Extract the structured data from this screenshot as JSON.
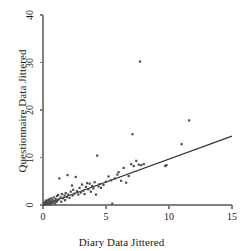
{
  "chart_data": {
    "type": "scatter",
    "title": "",
    "xlabel": "Diary Data Jittered",
    "ylabel": "Questionnaire Data Jittered",
    "xlim": [
      0,
      15
    ],
    "ylim": [
      0,
      40
    ],
    "xticks": [
      0,
      5,
      10,
      15
    ],
    "yticks": [
      0,
      10,
      20,
      30,
      40
    ],
    "xtick_labels": [
      "0",
      "5",
      "10",
      "15"
    ],
    "ytick_labels": [
      "0",
      "10",
      "20",
      "30",
      "40"
    ],
    "grid": false,
    "legend": null,
    "marker_color": "#4d4d4d",
    "line_color": "#333333",
    "axis_color": "#808080",
    "trendline": {
      "type": "linear",
      "x": [
        0,
        15
      ],
      "y": [
        0.0,
        14.5
      ],
      "slope": 0.967,
      "intercept": 0.0
    },
    "points": [
      {
        "x": 0.05,
        "y": 0.1
      },
      {
        "x": 0.08,
        "y": 0.3
      },
      {
        "x": 0.1,
        "y": 0.05
      },
      {
        "x": 0.12,
        "y": 0.5
      },
      {
        "x": 0.15,
        "y": 0.2
      },
      {
        "x": 0.18,
        "y": 0.6
      },
      {
        "x": 0.2,
        "y": 0.1
      },
      {
        "x": 0.22,
        "y": 0.9
      },
      {
        "x": 0.25,
        "y": 0.4
      },
      {
        "x": 0.28,
        "y": 0.15
      },
      {
        "x": 0.3,
        "y": 0.7
      },
      {
        "x": 0.32,
        "y": 0.25
      },
      {
        "x": 0.35,
        "y": 1.0
      },
      {
        "x": 0.38,
        "y": 0.5
      },
      {
        "x": 0.4,
        "y": 0.2
      },
      {
        "x": 0.42,
        "y": 0.8
      },
      {
        "x": 0.45,
        "y": 0.35
      },
      {
        "x": 0.48,
        "y": 1.2
      },
      {
        "x": 0.5,
        "y": 0.6
      },
      {
        "x": 0.55,
        "y": 0.1
      },
      {
        "x": 0.58,
        "y": 0.95
      },
      {
        "x": 0.6,
        "y": 0.45
      },
      {
        "x": 0.65,
        "y": 1.4
      },
      {
        "x": 0.68,
        "y": 0.7
      },
      {
        "x": 0.7,
        "y": 0.25
      },
      {
        "x": 0.75,
        "y": 1.1
      },
      {
        "x": 0.8,
        "y": 0.55
      },
      {
        "x": 0.85,
        "y": 1.6
      },
      {
        "x": 0.9,
        "y": 0.8
      },
      {
        "x": 0.95,
        "y": 0.3
      },
      {
        "x": 1.0,
        "y": 1.3
      },
      {
        "x": 1.05,
        "y": 0.6
      },
      {
        "x": 1.1,
        "y": 1.9
      },
      {
        "x": 1.15,
        "y": 0.9
      },
      {
        "x": 1.2,
        "y": 2.1
      },
      {
        "x": 1.25,
        "y": 1.2
      },
      {
        "x": 1.3,
        "y": 5.6
      },
      {
        "x": 1.4,
        "y": 1.6
      },
      {
        "x": 1.45,
        "y": 0.7
      },
      {
        "x": 1.5,
        "y": 2.3
      },
      {
        "x": 1.6,
        "y": 1.4
      },
      {
        "x": 1.7,
        "y": 2.0
      },
      {
        "x": 1.75,
        "y": 1.0
      },
      {
        "x": 1.8,
        "y": 2.5
      },
      {
        "x": 1.9,
        "y": 1.7
      },
      {
        "x": 1.95,
        "y": 6.3
      },
      {
        "x": 2.0,
        "y": 2.2
      },
      {
        "x": 2.1,
        "y": 1.5
      },
      {
        "x": 2.2,
        "y": 2.8
      },
      {
        "x": 2.3,
        "y": 4.1
      },
      {
        "x": 2.35,
        "y": 2.0
      },
      {
        "x": 2.4,
        "y": 3.2
      },
      {
        "x": 2.5,
        "y": 2.4
      },
      {
        "x": 2.6,
        "y": 5.9
      },
      {
        "x": 2.7,
        "y": 2.9
      },
      {
        "x": 2.8,
        "y": 2.2
      },
      {
        "x": 2.9,
        "y": 3.6
      },
      {
        "x": 3.0,
        "y": 2.6
      },
      {
        "x": 3.1,
        "y": 4.3
      },
      {
        "x": 3.2,
        "y": 3.0
      },
      {
        "x": 3.3,
        "y": 2.3
      },
      {
        "x": 3.4,
        "y": 3.8
      },
      {
        "x": 3.5,
        "y": 4.6
      },
      {
        "x": 3.6,
        "y": 3.3
      },
      {
        "x": 3.7,
        "y": 4.5
      },
      {
        "x": 3.8,
        "y": 2.8
      },
      {
        "x": 3.9,
        "y": 4.0
      },
      {
        "x": 4.0,
        "y": 3.5
      },
      {
        "x": 4.1,
        "y": 4.8
      },
      {
        "x": 4.2,
        "y": 2.2
      },
      {
        "x": 4.3,
        "y": 10.4
      },
      {
        "x": 4.4,
        "y": 3.9
      },
      {
        "x": 4.5,
        "y": 4.4
      },
      {
        "x": 4.6,
        "y": 3.6
      },
      {
        "x": 4.8,
        "y": 4.2
      },
      {
        "x": 5.0,
        "y": 4.9
      },
      {
        "x": 5.2,
        "y": 6.0
      },
      {
        "x": 5.4,
        "y": 5.2
      },
      {
        "x": 5.5,
        "y": 0.3
      },
      {
        "x": 5.7,
        "y": 5.6
      },
      {
        "x": 5.9,
        "y": 6.4
      },
      {
        "x": 6.0,
        "y": 6.9
      },
      {
        "x": 6.2,
        "y": 5.1
      },
      {
        "x": 6.4,
        "y": 7.8
      },
      {
        "x": 6.6,
        "y": 4.7
      },
      {
        "x": 6.8,
        "y": 6.1
      },
      {
        "x": 7.0,
        "y": 8.6
      },
      {
        "x": 7.1,
        "y": 14.9
      },
      {
        "x": 7.2,
        "y": 8.2
      },
      {
        "x": 7.4,
        "y": 9.3
      },
      {
        "x": 7.6,
        "y": 8.5
      },
      {
        "x": 7.7,
        "y": 30.2
      },
      {
        "x": 7.8,
        "y": 8.4
      },
      {
        "x": 8.0,
        "y": 8.6
      },
      {
        "x": 9.7,
        "y": 8.2
      },
      {
        "x": 9.8,
        "y": 8.4
      },
      {
        "x": 11.0,
        "y": 12.8
      },
      {
        "x": 11.6,
        "y": 17.8
      }
    ]
  }
}
